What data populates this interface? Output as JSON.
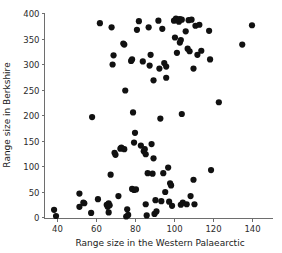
{
  "chart_data": {
    "type": "scatter",
    "title": "",
    "xlabel": "Range size in the Western Palaearctic",
    "ylabel": "Range size in Berkshire",
    "xlim": [
      32,
      155
    ],
    "ylim": [
      -12,
      405
    ],
    "xticks": [
      40,
      60,
      80,
      100,
      120,
      140
    ],
    "yticks": [
      0,
      50,
      100,
      150,
      200,
      250,
      300,
      350,
      400
    ],
    "xtick_labels": [
      "40",
      "60",
      "80",
      "100",
      "120",
      "140"
    ],
    "ytick_labels": [
      "0",
      "50",
      "100",
      "150",
      "200",
      "250",
      "300",
      "350",
      "400"
    ],
    "grid": false,
    "legend": "none",
    "marker": {
      "shape": "circle",
      "color": "#111111",
      "size": 3.1
    },
    "points": [
      [
        38.5,
        14
      ],
      [
        39.5,
        2
      ],
      [
        51.5,
        46
      ],
      [
        51.5,
        20
      ],
      [
        53.5,
        28
      ],
      [
        54.0,
        27
      ],
      [
        57.5,
        8
      ],
      [
        58.0,
        196
      ],
      [
        61.0,
        35
      ],
      [
        62.0,
        380
      ],
      [
        65.5,
        24
      ],
      [
        66.0,
        20
      ],
      [
        66.5,
        27
      ],
      [
        66.5,
        9
      ],
      [
        67.0,
        23
      ],
      [
        67.5,
        83
      ],
      [
        68.0,
        372
      ],
      [
        68.5,
        299
      ],
      [
        69.0,
        317
      ],
      [
        69.5,
        126
      ],
      [
        70.0,
        122
      ],
      [
        71.5,
        41
      ],
      [
        72.5,
        134
      ],
      [
        73.0,
        136
      ],
      [
        74.0,
        340
      ],
      [
        74.5,
        338
      ],
      [
        74.5,
        133
      ],
      [
        75.0,
        248
      ],
      [
        75.5,
        1
      ],
      [
        76.0,
        15
      ],
      [
        76.5,
        4
      ],
      [
        78.0,
        306
      ],
      [
        78.5,
        309
      ],
      [
        78.5,
        55
      ],
      [
        79.0,
        205
      ],
      [
        79.5,
        146
      ],
      [
        79.5,
        53
      ],
      [
        80.0,
        165
      ],
      [
        80.5,
        54
      ],
      [
        81.0,
        367
      ],
      [
        82.0,
        384
      ],
      [
        83.0,
        140
      ],
      [
        84.0,
        305
      ],
      [
        84.5,
        129
      ],
      [
        85.0,
        133
      ],
      [
        85.5,
        123
      ],
      [
        85.5,
        25
      ],
      [
        86.0,
        3
      ],
      [
        86.5,
        86
      ],
      [
        87.0,
        372
      ],
      [
        87.5,
        297
      ],
      [
        88.0,
        318
      ],
      [
        88.5,
        143
      ],
      [
        89.0,
        85
      ],
      [
        89.5,
        268
      ],
      [
        89.5,
        115
      ],
      [
        90.0,
        6
      ],
      [
        90.5,
        33
      ],
      [
        91.0,
        11
      ],
      [
        92.0,
        385
      ],
      [
        92.5,
        291
      ],
      [
        93.0,
        193
      ],
      [
        93.5,
        31
      ],
      [
        94.0,
        369
      ],
      [
        94.5,
        86
      ],
      [
        95.0,
        302
      ],
      [
        95.5,
        49
      ],
      [
        96.0,
        295
      ],
      [
        96.0,
        273
      ],
      [
        97.0,
        97
      ],
      [
        97.5,
        30
      ],
      [
        98.0,
        66
      ],
      [
        98.5,
        62
      ],
      [
        99.0,
        22
      ],
      [
        100.0,
        385
      ],
      [
        100.5,
        352
      ],
      [
        101.0,
        389
      ],
      [
        101.5,
        322
      ],
      [
        102.0,
        387
      ],
      [
        102.5,
        383
      ],
      [
        103.0,
        342
      ],
      [
        103.0,
        388
      ],
      [
        103.5,
        347
      ],
      [
        103.5,
        24
      ],
      [
        104.0,
        202
      ],
      [
        104.0,
        387
      ],
      [
        104.5,
        28
      ],
      [
        106.0,
        364
      ],
      [
        106.5,
        25
      ],
      [
        107.0,
        330
      ],
      [
        107.5,
        386
      ],
      [
        108.0,
        325
      ],
      [
        108.5,
        41
      ],
      [
        109.0,
        387
      ],
      [
        110.0,
        291
      ],
      [
        110.0,
        73
      ],
      [
        110.5,
        25
      ],
      [
        111.0,
        375
      ],
      [
        112.0,
        318
      ],
      [
        113.0,
        377
      ],
      [
        114.0,
        326
      ],
      [
        118.0,
        365
      ],
      [
        118.5,
        309
      ],
      [
        119.0,
        92
      ],
      [
        123.0,
        225
      ],
      [
        135.0,
        338
      ],
      [
        140.0,
        376
      ]
    ]
  }
}
